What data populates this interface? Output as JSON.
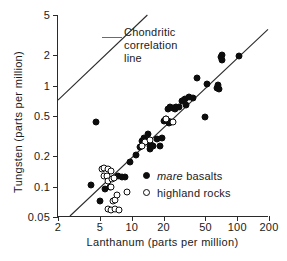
{
  "chart_data": {
    "type": "scatter",
    "title": "",
    "xlabel": "Lanthanum (parts per million)",
    "ylabel": "Tungsten (parts per million)",
    "xscale": "log",
    "yscale": "log",
    "xlim": [
      2,
      200
    ],
    "ylim": [
      0.05,
      5
    ],
    "xticks": [
      "2",
      "5",
      "10",
      "20",
      "50",
      "100",
      "200"
    ],
    "xtick_values": [
      2,
      5,
      10,
      20,
      50,
      100,
      200
    ],
    "yticks": [
      "0.05",
      "0.1",
      "0.2",
      "0.5",
      "1",
      "2",
      "5"
    ],
    "ytick_values": [
      0.05,
      0.1,
      0.2,
      0.5,
      1,
      2,
      5
    ],
    "grid": false,
    "legend_position": "lower-right-inside",
    "annotations": [
      {
        "name": "chondritic-correlation-line-label",
        "lines": [
          "Chondritic",
          "correlation",
          "line"
        ],
        "leader_from": [
          2.0,
          0.7
        ],
        "leader_to": [
          5.5,
          1.9
        ]
      }
    ],
    "lines": [
      {
        "name": "chondritic-correlation-line",
        "label": "Chondritic correlation line",
        "p1": [
          2,
          0.71
        ],
        "p2": [
          14.2,
          5.0
        ]
      },
      {
        "name": "lunar-correlation-line",
        "label": "",
        "p1": [
          2.6,
          0.05
        ],
        "p2": [
          200,
          3.6
        ]
      }
    ],
    "series": [
      {
        "name": "mare basalts",
        "marker": "filled-circle",
        "color": "#0d0d0d",
        "points": [
          [
            4.6,
            0.44
          ],
          [
            4.1,
            0.103
          ],
          [
            5.0,
            0.072
          ],
          [
            5.6,
            0.094
          ],
          [
            6.2,
            0.098
          ],
          [
            7.4,
            0.126
          ],
          [
            8.0,
            0.125
          ],
          [
            8.7,
            0.124
          ],
          [
            9.6,
            0.175
          ],
          [
            11.0,
            0.205
          ],
          [
            12.0,
            0.245
          ],
          [
            12.6,
            0.285
          ],
          [
            13.0,
            0.3
          ],
          [
            13.6,
            0.29
          ],
          [
            14.3,
            0.33
          ],
          [
            14.8,
            0.235
          ],
          [
            15.2,
            0.26
          ],
          [
            15.0,
            0.25
          ],
          [
            16.0,
            0.255
          ],
          [
            17.2,
            0.295
          ],
          [
            18.5,
            0.255
          ],
          [
            19.3,
            0.3
          ],
          [
            20.0,
            0.45
          ],
          [
            20.6,
            0.46
          ],
          [
            21.3,
            0.47
          ],
          [
            22.0,
            0.45
          ],
          [
            22.6,
            0.43
          ],
          [
            23.5,
            0.44
          ],
          [
            22.0,
            0.58
          ],
          [
            23.0,
            0.61
          ],
          [
            24.5,
            0.6
          ],
          [
            25.5,
            0.59
          ],
          [
            26.5,
            0.62
          ],
          [
            28.0,
            0.61
          ],
          [
            30.0,
            0.7
          ],
          [
            31.0,
            0.72
          ],
          [
            32.0,
            0.74
          ],
          [
            33.0,
            0.64
          ],
          [
            35.0,
            0.77
          ],
          [
            38.0,
            0.76
          ],
          [
            42.0,
            1.18
          ],
          [
            50.0,
            0.49
          ],
          [
            52.0,
            1.03
          ],
          [
            64.0,
            0.95
          ],
          [
            66.0,
            1.02
          ],
          [
            67.0,
            0.93
          ],
          [
            70.0,
            1.9
          ],
          [
            71.0,
            2.0
          ],
          [
            72.0,
            1.78
          ],
          [
            105.0,
            1.97
          ]
        ]
      },
      {
        "name": "highland rocks",
        "marker": "open-circle",
        "color": "#ffffff",
        "points": [
          [
            5.2,
            0.148
          ],
          [
            5.5,
            0.152
          ],
          [
            5.4,
            0.128
          ],
          [
            5.8,
            0.127
          ],
          [
            6.0,
            0.15
          ],
          [
            6.3,
            0.143
          ],
          [
            6.0,
            0.113
          ],
          [
            6.5,
            0.118
          ],
          [
            6.8,
            0.122
          ],
          [
            6.4,
            0.098
          ],
          [
            5.9,
            0.06
          ],
          [
            6.3,
            0.058
          ],
          [
            6.6,
            0.072
          ],
          [
            7.0,
            0.074
          ],
          [
            7.2,
            0.082
          ],
          [
            7.0,
            0.06
          ],
          [
            7.6,
            0.059
          ],
          [
            9.0,
            0.089
          ],
          [
            13.5,
            0.275
          ],
          [
            12.5,
            0.255
          ],
          [
            15.0,
            0.29
          ],
          [
            21.0,
            0.47
          ],
          [
            24.5,
            0.44
          ]
        ]
      }
    ]
  },
  "legend": {
    "items": [
      {
        "emphasis": "mare",
        "rest": " basalts",
        "marker": "filled-circle"
      },
      {
        "emphasis": "",
        "rest": "highland rocks",
        "marker": "open-circle"
      }
    ]
  },
  "colors": {
    "ink": "#1a1a1a",
    "axis": "#2a2a2a",
    "marker_fill": "#0d0d0d",
    "background": "#ffffff",
    "leader": "#6b6b6b"
  }
}
